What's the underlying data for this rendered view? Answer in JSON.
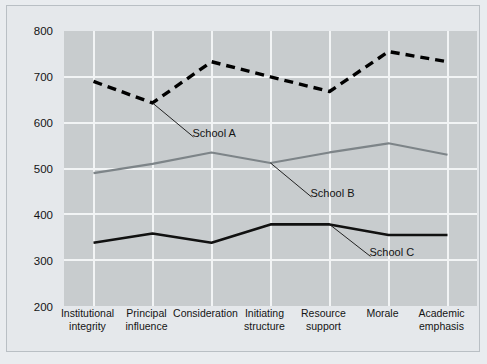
{
  "chart_data": {
    "type": "line",
    "title": "",
    "subtitle": "",
    "xlabel": "",
    "ylabel": "",
    "categories": [
      "Institutional integrity",
      "Principal influence",
      "Consideration",
      "Initiating structure",
      "Resource support",
      "Morale",
      "Academic emphasis"
    ],
    "category_lines": [
      [
        "Institutional",
        "integrity"
      ],
      [
        "Principal",
        "influence"
      ],
      [
        "Consideration",
        ""
      ],
      [
        "Initiating",
        "structure"
      ],
      [
        "Resource",
        "support"
      ],
      [
        "Morale",
        ""
      ],
      [
        "Academic",
        "emphasis"
      ]
    ],
    "ylim": [
      200,
      800
    ],
    "yticks": [
      200,
      300,
      400,
      500,
      600,
      700,
      800
    ],
    "grid": true,
    "legend_position": "inline-annotations",
    "series": [
      {
        "name": "School A",
        "style": "dashed",
        "color": "#000000",
        "values": [
          690,
          643,
          733,
          700,
          668,
          755,
          733
        ]
      },
      {
        "name": "School B",
        "style": "solid",
        "color": "#7d8488",
        "values": [
          490,
          510,
          535,
          512,
          535,
          555,
          530
        ]
      },
      {
        "name": "School C",
        "style": "solid",
        "color": "#111111",
        "values": [
          338,
          358,
          338,
          378,
          378,
          355,
          355
        ]
      }
    ],
    "annotations": [
      {
        "text": "School A",
        "anchor_category_index": 1,
        "anchor_series": "School A"
      },
      {
        "text": "School B",
        "anchor_category_index": 3,
        "anchor_series": "School B"
      },
      {
        "text": "School C",
        "anchor_category_index": 4,
        "anchor_series": "School C"
      }
    ],
    "colors": {
      "plot_background": "#c8ccce",
      "figure_background": "#e5e8eb",
      "gridline": "#f2f4f5",
      "text": "#141414"
    }
  }
}
